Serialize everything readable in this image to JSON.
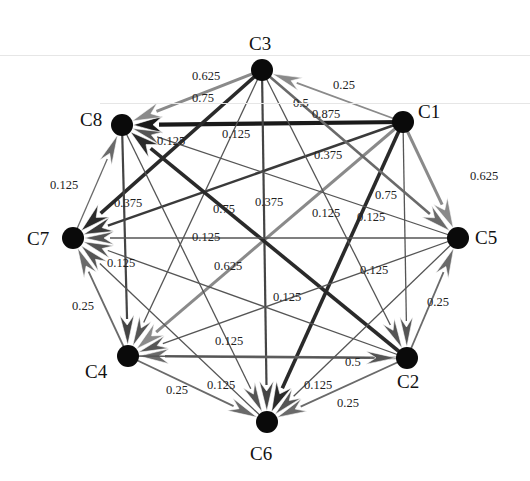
{
  "figure": {
    "type": "directed weighted network",
    "nodes": [
      {
        "id": "C1",
        "label": "C1",
        "x": 403,
        "y": 122,
        "lx": 418,
        "ly": 118
      },
      {
        "id": "C2",
        "label": "C2",
        "x": 407,
        "y": 358,
        "lx": 397,
        "ly": 388
      },
      {
        "id": "C3",
        "label": "C3",
        "x": 262,
        "y": 70,
        "lx": 249,
        "ly": 50
      },
      {
        "id": "C4",
        "label": "C4",
        "x": 128,
        "y": 356,
        "lx": 85,
        "ly": 378
      },
      {
        "id": "C5",
        "label": "C5",
        "x": 458,
        "y": 238,
        "lx": 475,
        "ly": 244
      },
      {
        "id": "C6",
        "label": "C6",
        "x": 267,
        "y": 422,
        "lx": 250,
        "ly": 460
      },
      {
        "id": "C7",
        "label": "C7",
        "x": 73,
        "y": 238,
        "lx": 27,
        "ly": 245
      },
      {
        "id": "C8",
        "label": "C8",
        "x": 122,
        "y": 125,
        "lx": 80,
        "ly": 126
      }
    ],
    "edges": [
      {
        "from": "C1",
        "to": "C8",
        "weight": "0.875",
        "color": "#1a1a1a",
        "width": 4.2,
        "lx": 312,
        "ly": 118
      },
      {
        "from": "C1",
        "to": "C3",
        "weight": "0.25",
        "color": "#8a8a8a",
        "width": 1.8,
        "lx": 333,
        "ly": 89
      },
      {
        "from": "C1",
        "to": "C5",
        "weight": "0.625",
        "color": "#8a8a8a",
        "width": 3.0,
        "lx": 470,
        "ly": 180
      },
      {
        "from": "C1",
        "to": "C7",
        "weight": "0.375",
        "color": "#3a3a3a",
        "width": 2.4,
        "lx": 314,
        "ly": 159
      },
      {
        "from": "C1",
        "to": "C6",
        "weight": "0.75",
        "color": "#2a2a2a",
        "width": 3.6,
        "lx": 375,
        "ly": 199
      },
      {
        "from": "C1",
        "to": "C4",
        "weight": "0.625",
        "color": "#8a8a8a",
        "width": 3.0,
        "lx": 214,
        "ly": 270
      },
      {
        "from": "C1",
        "to": "C2",
        "weight": "0.125",
        "color": "#555555",
        "width": 1.3,
        "lx": 357,
        "ly": 221
      },
      {
        "from": "C3",
        "to": "C8",
        "weight": "0.625",
        "color": "#8a8a8a",
        "width": 3.0,
        "lx": 192,
        "ly": 80
      },
      {
        "from": "C3",
        "to": "C7",
        "weight": "0.75",
        "color": "#2a2a2a",
        "width": 3.6,
        "lx": 192,
        "ly": 102
      },
      {
        "from": "C3",
        "to": "C6",
        "weight": "0.375",
        "color": "#444444",
        "width": 2.2,
        "lx": 255,
        "ly": 206
      },
      {
        "from": "C3",
        "to": "C5",
        "weight": "0.5",
        "color": "#6a6a6a",
        "width": 2.6,
        "lx": 293,
        "ly": 107
      },
      {
        "from": "C3",
        "to": "C4",
        "weight": "0.125",
        "color": "#555555",
        "width": 1.3,
        "lx": 222,
        "ly": 138
      },
      {
        "from": "C3",
        "to": "C2",
        "weight": "0.125",
        "color": "#555555",
        "width": 1.3,
        "lx": 312,
        "ly": 217
      },
      {
        "from": "C2",
        "to": "C8",
        "weight": "0.75",
        "color": "#2a2a2a",
        "width": 3.6,
        "lx": 213,
        "ly": 213
      },
      {
        "from": "C8",
        "to": "C4",
        "weight": "0.375",
        "color": "#444444",
        "width": 2.2,
        "lx": 114,
        "ly": 207
      },
      {
        "from": "C7",
        "to": "C8",
        "weight": "0.125",
        "color": "#6a6a6a",
        "width": 1.3,
        "lx": 50,
        "ly": 189
      },
      {
        "from": "C4",
        "to": "C7",
        "weight": "0.25",
        "color": "#6a6a6a",
        "width": 1.8,
        "lx": 72,
        "ly": 310
      },
      {
        "from": "C4",
        "to": "C6",
        "weight": "0.25",
        "color": "#6a6a6a",
        "width": 1.8,
        "lx": 166,
        "ly": 394
      },
      {
        "from": "C2",
        "to": "C4",
        "weight": "0.5",
        "color": "#6a6a6a",
        "width": 2.6,
        "lx": 345,
        "ly": 366
      },
      {
        "from": "C2",
        "to": "C6",
        "weight": "0.25",
        "color": "#6a6a6a",
        "width": 1.8,
        "lx": 337,
        "ly": 407
      },
      {
        "from": "C2",
        "to": "C5",
        "weight": "0.25",
        "color": "#6a6a6a",
        "width": 1.8,
        "lx": 427,
        "ly": 306
      },
      {
        "from": "C5",
        "to": "C7",
        "weight": "0.125",
        "color": "#555555",
        "width": 1.3,
        "lx": 192,
        "ly": 241
      },
      {
        "from": "C5",
        "to": "C8",
        "weight": "0.125",
        "color": "#555555",
        "width": 1.3,
        "lx": 157,
        "ly": 145
      },
      {
        "from": "C5",
        "to": "C4",
        "weight": "0.125",
        "color": "#555555",
        "width": 1.3,
        "lx": 273,
        "ly": 301
      },
      {
        "from": "C5",
        "to": "C6",
        "weight": "0.125",
        "color": "#555555",
        "width": 1.3,
        "lx": 360,
        "ly": 274
      },
      {
        "from": "C6",
        "to": "C7",
        "weight": "0.125",
        "color": "#555555",
        "width": 1.3,
        "lx": 107,
        "ly": 267
      },
      {
        "from": "C2",
        "to": "C7",
        "weight": "0.125",
        "color": "#555555",
        "width": 1.3,
        "lx": 215,
        "ly": 345
      },
      {
        "from": "C8",
        "to": "C6",
        "weight": "0.125",
        "color": "#555555",
        "width": 1.3,
        "lx": 207,
        "ly": 389
      },
      {
        "from": "C4",
        "to": "C2",
        "weight": "0.125",
        "color": "#555555",
        "width": 1.3,
        "lx": 304,
        "ly": 389
      }
    ]
  },
  "background_text": [
    {
      "text": "The proportion of the three types of relations",
      "x": 280,
      "y": 318,
      "size": 18
    },
    {
      "text": "in the ... of the ... for ... communities ...",
      "x": 250,
      "y": 355,
      "size": 17
    }
  ]
}
